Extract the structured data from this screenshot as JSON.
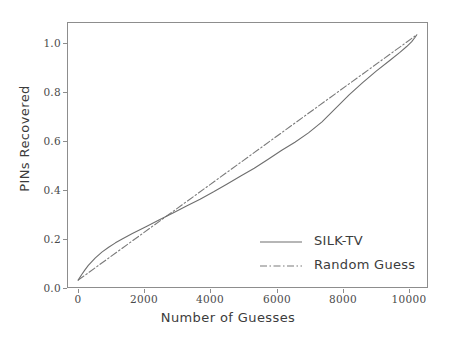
{
  "chart_data": {
    "type": "line",
    "title": "",
    "xlabel": "Number of Guesses",
    "ylabel": "PINs Recovered",
    "xlim": [
      -330,
      10330
    ],
    "ylim": [
      -0.032,
      1.052
    ],
    "xticks": [
      0,
      2000,
      4000,
      6000,
      8000,
      10000
    ],
    "xticklabels": [
      "0",
      "2000",
      "4000",
      "6000",
      "8000",
      "10000"
    ],
    "yticks": [
      0.0,
      0.2,
      0.4,
      0.6,
      0.8,
      1.0
    ],
    "yticklabels": [
      "0.0",
      "0.2",
      "0.4",
      "0.6",
      "0.8",
      "1.0"
    ],
    "grid": false,
    "legend_position": "lower right",
    "colors": {
      "silk_tv": "#6e6e6e",
      "random_guess": "#7a7a7a",
      "axis": "#8d8d8d",
      "text": "#3c3c3c",
      "background": "#ffffff"
    },
    "series": [
      {
        "name": "SILK-TV",
        "style": "solid",
        "color": "#6e6e6e",
        "x": [
          0,
          100,
          200,
          300,
          500,
          700,
          900,
          1100,
          1300,
          1600,
          2000,
          2400,
          2800,
          3200,
          3600,
          4000,
          4400,
          4800,
          5200,
          5600,
          6000,
          6400,
          6800,
          7200,
          7600,
          8000,
          8400,
          8800,
          9200,
          9500,
          9700,
          9850,
          9950,
          10000
        ],
        "y": [
          0.0,
          0.022,
          0.042,
          0.06,
          0.09,
          0.114,
          0.134,
          0.152,
          0.168,
          0.19,
          0.218,
          0.246,
          0.274,
          0.302,
          0.33,
          0.36,
          0.392,
          0.424,
          0.456,
          0.492,
          0.528,
          0.562,
          0.6,
          0.645,
          0.7,
          0.755,
          0.805,
          0.852,
          0.895,
          0.928,
          0.952,
          0.972,
          0.99,
          1.0
        ]
      },
      {
        "name": "Random Guess",
        "style": "dashdot",
        "color": "#7a7a7a",
        "x": [
          0,
          10000
        ],
        "y": [
          0.0,
          1.0
        ]
      }
    ]
  },
  "legend": {
    "items": [
      {
        "label": "SILK-TV",
        "style": "solid"
      },
      {
        "label": "Random Guess",
        "style": "dashdot"
      }
    ]
  }
}
